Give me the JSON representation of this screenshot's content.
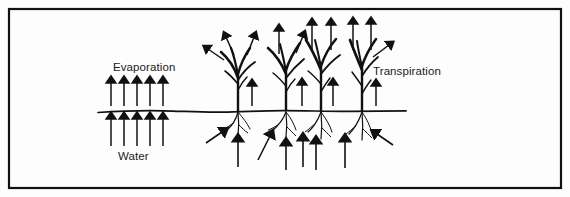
{
  "figure": {
    "title_visible": false,
    "background_color": "#fdfdfd",
    "ink_color": "#111111",
    "border": {
      "name": "figure-border",
      "x": 8,
      "y": 8,
      "width": 554,
      "height": 181,
      "stroke_width": 2.2
    },
    "ground_line": {
      "name": "ground-surface-line",
      "x_start": 98,
      "x_end": 406,
      "y": 111,
      "stroke_width": 1.6,
      "description": "slightly undulating soil surface line"
    }
  },
  "labels": {
    "evaporation": {
      "text": "Evaporation",
      "x": 113,
      "y": 71
    },
    "transpiration": {
      "text": "Transpiration",
      "x": 373,
      "y": 75
    },
    "water": {
      "text": "Water",
      "x": 118,
      "y": 160
    }
  },
  "diagram_data": {
    "type": "diagram",
    "subject": "Evaporation and transpiration from bare soil and plants",
    "evaporation_arrows_above_ground": {
      "count": 5,
      "direction": "up",
      "x_positions": [
        111,
        124,
        137,
        150,
        163
      ],
      "y_top": 80,
      "y_bottom": 106
    },
    "evaporation_arrows_below_ground": {
      "count": 5,
      "direction": "up",
      "x_positions": [
        111,
        124,
        137,
        150,
        163
      ],
      "y_top": 116,
      "y_bottom": 145
    },
    "plants": [
      {
        "id": "plant-1",
        "stem_x": 238,
        "base_y": 111,
        "transpiration_arrows": 4,
        "soil_uptake_arrows": 2
      },
      {
        "id": "plant-2",
        "stem_x": 286,
        "base_y": 111,
        "transpiration_arrows": 3,
        "soil_uptake_arrows": 2
      },
      {
        "id": "plant-3",
        "stem_x": 321,
        "base_y": 111,
        "transpiration_arrows": 4,
        "soil_uptake_arrows": 3
      },
      {
        "id": "plant-4",
        "stem_x": 362,
        "base_y": 111,
        "transpiration_arrows": 4,
        "soil_uptake_arrows": 2
      }
    ]
  }
}
